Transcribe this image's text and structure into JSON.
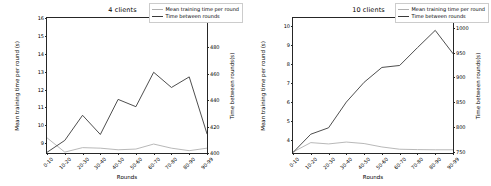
{
  "figure": {
    "background": "#ffffff",
    "series_colors": {
      "mean_training_time": "#b0b0b0",
      "time_between_rounds": "#3a3a3a"
    }
  },
  "panels": [
    {
      "id": "panel-4-clients",
      "title": "4 clients",
      "legend": [
        "Mean training time per round",
        "Time between rounds"
      ],
      "xlabel": "Rounds",
      "ylabel_left": "Mean training time per round (s)",
      "ylabel_right": "Time between rounds(s)",
      "xticks": [
        "0-10",
        "10-20",
        "20-30",
        "30-40",
        "40-50",
        "50-60",
        "60-70",
        "70-80",
        "80-90",
        "90-99"
      ],
      "yticks_left": [
        "9",
        "10",
        "11",
        "12",
        "13",
        "14",
        "15",
        "16"
      ],
      "yticks_right": [
        "400",
        "420",
        "440",
        "460",
        "480",
        "500"
      ]
    },
    {
      "id": "panel-10-clients",
      "title": "10 clients",
      "legend": [
        "Mean training time per round",
        "Time between rounds"
      ],
      "xlabel": "Rounds",
      "ylabel_left": "Mean training time per round (s)",
      "ylabel_right": "Time between rounds(s)",
      "xticks": [
        "0-10",
        "10-20",
        "20-30",
        "30-40",
        "40-50",
        "50-60",
        "60-70",
        "70-80",
        "80-90",
        "90-99"
      ],
      "yticks_left": [
        "4",
        "5",
        "6",
        "7",
        "8",
        "9",
        "10"
      ],
      "yticks_right": [
        "750",
        "800",
        "850",
        "900",
        "950",
        "1000"
      ]
    }
  ],
  "chart_data": [
    {
      "type": "line",
      "title": "4 clients",
      "xlabel": "Rounds",
      "ylabel": "Mean training time per round (s)",
      "ylabel_secondary": "Time between rounds(s)",
      "categories": [
        "0-10",
        "10-20",
        "20-30",
        "30-40",
        "40-50",
        "50-60",
        "60-70",
        "70-80",
        "80-90",
        "90-99"
      ],
      "ylim": [
        8.45,
        16.0
      ],
      "ylim_secondary": [
        400,
        502
      ],
      "grid": false,
      "legend_position": "upper right",
      "series": [
        {
          "name": "Mean training time per round",
          "axis": "left",
          "color": "#b0b0b0",
          "values": [
            9.3,
            8.5,
            8.75,
            8.72,
            8.63,
            8.67,
            8.95,
            8.72,
            8.58,
            8.72
          ]
        },
        {
          "name": "Time between rounds",
          "axis": "right",
          "color": "#3a3a3a",
          "values": [
            400.5,
            409.5,
            428.5,
            414.0,
            440.5,
            435.0,
            461.0,
            449.5,
            457.5,
            414.5
          ]
        }
      ]
    },
    {
      "type": "line",
      "title": "10 clients",
      "xlabel": "Rounds",
      "ylabel": "Mean training time per round (s)",
      "ylabel_secondary": "Time between rounds(s)",
      "categories": [
        "0-10",
        "10-20",
        "20-30",
        "30-40",
        "40-50",
        "50-60",
        "60-70",
        "70-80",
        "80-90",
        "90-99"
      ],
      "ylim": [
        3.3,
        10.45
      ],
      "ylim_secondary": [
        747,
        1020
      ],
      "grid": false,
      "legend_position": "upper right",
      "series": [
        {
          "name": "Mean training time per round",
          "axis": "left",
          "color": "#b0b0b0",
          "values": [
            3.35,
            3.85,
            3.78,
            3.88,
            3.8,
            3.62,
            3.5,
            3.48,
            3.47,
            3.47
          ]
        },
        {
          "name": "Time between rounds",
          "axis": "right",
          "color": "#3a3a3a",
          "values": [
            748,
            785,
            798,
            850,
            890,
            920,
            924,
            960,
            995,
            948
          ]
        }
      ]
    }
  ]
}
